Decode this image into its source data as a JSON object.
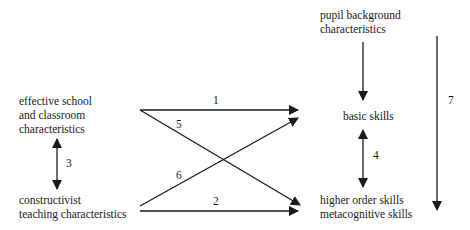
{
  "diagram": {
    "nodes": {
      "effective_school": {
        "lines": [
          "effective school",
          "and classroom",
          "characteristics"
        ]
      },
      "constructivist": {
        "lines": [
          "constructivist",
          "teaching characteristics"
        ]
      },
      "pupil_background": {
        "lines": [
          "pupil background",
          "characteristics"
        ]
      },
      "basic_skills": {
        "lines": [
          "basic skills"
        ]
      },
      "higher_order": {
        "lines": [
          "higher order skills",
          "metacognitive skills"
        ]
      }
    },
    "edges": [
      {
        "id": "1",
        "label": "1",
        "from": "effective school and classroom characteristics",
        "to": "basic skills",
        "type": "directed"
      },
      {
        "id": "2",
        "label": "2",
        "from": "constructivist teaching characteristics",
        "to": "higher order skills metacognitive skills",
        "type": "directed"
      },
      {
        "id": "3",
        "label": "3",
        "from": "effective school and classroom characteristics",
        "to": "constructivist teaching characteristics",
        "type": "bidirectional"
      },
      {
        "id": "4",
        "label": "4",
        "from": "basic skills",
        "to": "higher order skills metacognitive skills",
        "type": "bidirectional"
      },
      {
        "id": "5",
        "label": "5",
        "from": "effective school and classroom characteristics",
        "to": "higher order skills metacognitive skills",
        "type": "directed"
      },
      {
        "id": "6",
        "label": "6",
        "from": "constructivist teaching characteristics",
        "to": "basic skills",
        "type": "directed"
      },
      {
        "id": "7",
        "label": "7",
        "from": "pupil background characteristics",
        "to": "higher order skills metacognitive skills",
        "type": "directed"
      },
      {
        "id": "pb",
        "label": "",
        "from": "pupil background characteristics",
        "to": "basic skills",
        "type": "directed"
      }
    ],
    "colors": {
      "line": "#1a1a1a",
      "background": "#ffffff"
    }
  }
}
